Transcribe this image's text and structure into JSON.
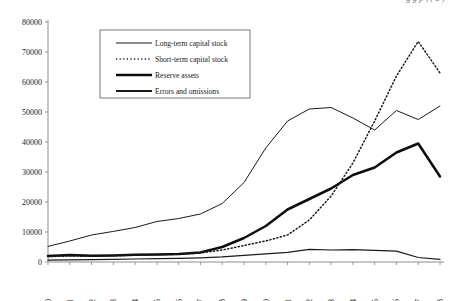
{
  "caption": {
    "partial_top_line": "g g p , ( $ )"
  },
  "chart_data": {
    "type": "line",
    "title": "",
    "xlabel": "",
    "ylabel": "",
    "ylim": [
      0,
      80000
    ],
    "xlim": [
      1980,
      1998
    ],
    "grid": false,
    "legend_position": "top-left-inside",
    "ytick_labels": [
      "0",
      "10000",
      "20000",
      "30000",
      "40000",
      "50000",
      "60000",
      "70000",
      "80000"
    ],
    "ytick_values": [
      0,
      10000,
      20000,
      30000,
      40000,
      50000,
      60000,
      70000,
      80000
    ],
    "x": [
      1980,
      1981,
      1982,
      1983,
      1984,
      1985,
      1986,
      1987,
      1988,
      1989,
      1990,
      1991,
      1992,
      1993,
      1994,
      1995,
      1996,
      1997,
      1998
    ],
    "xtick_labels": [
      "1980",
      "1981",
      "1982",
      "1983",
      "1984",
      "1985",
      "1986",
      "1987",
      "1988",
      "1989",
      "1990",
      "1991",
      "1992",
      "1993",
      "1994",
      "1995",
      "1996",
      "1997",
      "1998"
    ],
    "series": [
      {
        "name": "Long-term capital stock",
        "style": "thin-solid",
        "values": [
          5200,
          7000,
          9000,
          10200,
          11500,
          13500,
          14500,
          16000,
          19500,
          26500,
          38000,
          47000,
          51000,
          51500,
          48000,
          44000,
          50500,
          47500,
          52000
        ]
      },
      {
        "name": "Short-term capital stock",
        "style": "dotted",
        "values": [
          1800,
          2000,
          1900,
          2100,
          2300,
          2400,
          2600,
          3000,
          4000,
          5500,
          7000,
          9000,
          14000,
          22000,
          33000,
          47000,
          62000,
          73500,
          63000
        ]
      },
      {
        "name": "Reserve assets",
        "style": "thick-solid",
        "values": [
          2000,
          2300,
          2100,
          2200,
          2400,
          2500,
          2700,
          3200,
          5000,
          8000,
          12000,
          17500,
          21000,
          24500,
          29000,
          31500,
          36500,
          39500,
          28500
        ]
      },
      {
        "name": "Errors and omissions",
        "style": "medium-solid",
        "values": [
          600,
          700,
          800,
          900,
          1000,
          1100,
          1200,
          1400,
          1700,
          2200,
          2700,
          3200,
          4200,
          4000,
          4100,
          3900,
          3600,
          1500,
          900
        ]
      }
    ]
  },
  "legend": {
    "items": [
      {
        "label": "Long-term capital stock",
        "swatch": "thin-solid-line-swatch"
      },
      {
        "label": "Short-term capital stock",
        "swatch": "dotted-line-swatch"
      },
      {
        "label": "Reserve assets",
        "swatch": "thick-solid-line-swatch"
      },
      {
        "label": "Errors and omissions",
        "swatch": "medium-solid-line-swatch"
      }
    ]
  },
  "colors": {
    "ink": "#1a1a1a",
    "axis": "#8d8d8d",
    "background": "#ffffff"
  }
}
